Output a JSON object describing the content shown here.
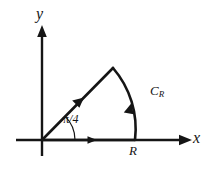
{
  "figure": {
    "background_color": "#ffffff",
    "stroke_color": "#151515",
    "axes": {
      "x_label": "x",
      "y_label": "y",
      "origin": {
        "x": 42,
        "y": 140
      },
      "x_axis_start": {
        "x": 16,
        "y": 140
      },
      "x_axis_end": {
        "x": 191,
        "y": 140
      },
      "y_axis_top": {
        "x": 42,
        "y": 27
      },
      "y_axis_bottom": {
        "x": 42,
        "y": 156
      }
    },
    "labels": {
      "angle": "/4",
      "angle_symbol": "π",
      "radius": "R",
      "arc": "C",
      "arc_subscript": "R"
    },
    "contour": {
      "type": "circular sector",
      "angle_degrees": 45,
      "angle_radians_text": "π/4",
      "radius_label": "R",
      "radius_pixels": 93,
      "apex": {
        "x": 113,
        "y": 68
      },
      "arc_endpoint_on_x_axis": {
        "x": 135,
        "y": 140
      },
      "segments": [
        {
          "name": "base-segment",
          "from": "origin",
          "to": "R",
          "direction": "rightward"
        },
        {
          "name": "arc-segment",
          "from": "R",
          "to": "apex",
          "direction": "counterclockwise"
        },
        {
          "name": "ray-segment",
          "from": "apex",
          "to": "origin",
          "direction": "inward"
        }
      ]
    }
  }
}
